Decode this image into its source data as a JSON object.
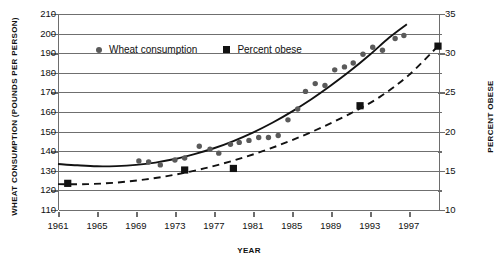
{
  "chart_data": {
    "type": "scatter",
    "title": "",
    "xlabel": "YEAR",
    "ylabel": "WHEAT CONSUMPTION (POUNDS PER PERSON)",
    "y2label": "PERCENT OBESE",
    "xlim": [
      1961,
      2000
    ],
    "ylim": [
      110,
      210
    ],
    "y2lim": [
      10,
      35
    ],
    "xticks": [
      1961,
      1965,
      1969,
      1973,
      1977,
      1981,
      1985,
      1989,
      1993,
      1997
    ],
    "yticks": [
      110,
      120,
      130,
      140,
      150,
      160,
      170,
      180,
      190,
      200,
      210
    ],
    "y2ticks": [
      10,
      15,
      20,
      25,
      30,
      35
    ],
    "grid": "horizontal",
    "legend_position": "upper-left-inside",
    "series": [
      {
        "name": "Wheat consumption",
        "marker": "circle",
        "axis": "left",
        "units": "pounds per person",
        "color": "#5a5a5a",
        "x": [
          1969.3,
          1970.3,
          1971.5,
          1973.0,
          1974.0,
          1975.5,
          1976.6,
          1977.5,
          1978.7,
          1979.6,
          1980.6,
          1981.6,
          1982.6,
          1983.6,
          1984.6,
          1985.6,
          1986.4,
          1987.4,
          1988.4,
          1989.4,
          1990.4,
          1991.3,
          1992.3,
          1993.3,
          1994.3,
          1995.6,
          1996.5
        ],
        "y": [
          135.0,
          134.5,
          133.0,
          135.5,
          136.5,
          142.5,
          141.0,
          139.0,
          143.5,
          144.5,
          145.5,
          147.0,
          147.0,
          148.0,
          156.0,
          161.5,
          170.5,
          174.5,
          173.5,
          181.5,
          183.0,
          185.0,
          189.5,
          193.0,
          191.5,
          197.5,
          199.0
        ]
      },
      {
        "name": "Percent obese",
        "marker": "square",
        "axis": "right",
        "units": "percent",
        "color": "#121212",
        "x": [
          1962.0,
          1974.0,
          1979.0,
          1992.0,
          2000.0
        ],
        "y": [
          13.4,
          15.1,
          15.3,
          23.3,
          30.9
        ]
      }
    ],
    "trendlines": [
      {
        "name": "Wheat consumption trend",
        "style": "solid",
        "axis": "left",
        "x": [
          1961.0,
          1963.0,
          1965.0,
          1967.0,
          1969.0,
          1971.0,
          1973.0,
          1975.0,
          1977.0,
          1979.0,
          1981.0,
          1983.0,
          1985.0,
          1987.0,
          1989.0,
          1991.0,
          1993.0,
          1995.0,
          1996.8
        ],
        "y": [
          133.5,
          132.8,
          132.3,
          132.4,
          133.0,
          134.2,
          136.0,
          138.5,
          141.5,
          145.2,
          149.5,
          154.5,
          160.2,
          166.5,
          173.5,
          181.0,
          189.2,
          198.0,
          204.8
        ]
      },
      {
        "name": "Percent obese trend",
        "style": "dashed",
        "axis": "right",
        "x": [
          1961.0,
          1964.0,
          1967.0,
          1970.0,
          1973.0,
          1976.0,
          1979.0,
          1982.0,
          1985.0,
          1988.0,
          1991.0,
          1994.0,
          1997.0,
          2000.0
        ],
        "y": [
          13.3,
          13.3,
          13.5,
          13.9,
          14.5,
          15.3,
          16.3,
          17.5,
          18.9,
          20.5,
          22.3,
          24.4,
          27.2,
          30.9
        ]
      }
    ]
  },
  "legend": {
    "items": [
      {
        "label": "Wheat consumption",
        "marker": "circle"
      },
      {
        "label": "Percent obese",
        "marker": "square"
      }
    ]
  }
}
